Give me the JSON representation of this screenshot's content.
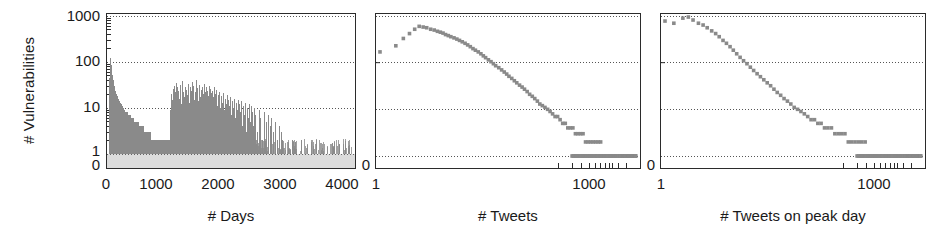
{
  "figure": {
    "background": "#ffffff",
    "marker_color": "#8a8a8a",
    "axis_color": "#2b2b2b",
    "grid_color": "#555555"
  },
  "chart_data": [
    {
      "type": "bar",
      "title": "",
      "panel_index": 1,
      "xlabel": "# Days",
      "ylabel": "# Vulnerabilities",
      "xscale": "linear",
      "yscale": "log",
      "xlim": [
        0,
        4000
      ],
      "ylim": [
        1,
        1000
      ],
      "grid": true,
      "legend": "none",
      "xticks": [
        "0",
        "1000",
        "2000",
        "3000",
        "4000"
      ],
      "xtick_values": [
        0,
        1000,
        2000,
        3000,
        4000
      ],
      "yticks": [
        "1000",
        "100",
        "10",
        "1",
        "0"
      ],
      "ytick_values": [
        1000,
        100,
        10,
        1,
        0
      ],
      "description": "Dense vertical spike histogram of vulnerability counts per day",
      "x": [
        5,
        12,
        18,
        25,
        30,
        36,
        42,
        48,
        55,
        60,
        66,
        72,
        78,
        84,
        90,
        96,
        102,
        108,
        114,
        120,
        126,
        132,
        138,
        144,
        150,
        156,
        162,
        168,
        174,
        180,
        186,
        192,
        198,
        204,
        210,
        216,
        222,
        228,
        234,
        240,
        250,
        260,
        270,
        280,
        290,
        300,
        312,
        324,
        336,
        348,
        360,
        372,
        384,
        396,
        408,
        420,
        432,
        444,
        456,
        468,
        480,
        492,
        504,
        516,
        528,
        540,
        552,
        564,
        576,
        588,
        600,
        612,
        624,
        636,
        648,
        660,
        672,
        684,
        696,
        708,
        720,
        732,
        744,
        756,
        768,
        780,
        792,
        804,
        816,
        828,
        840,
        852,
        864,
        876,
        888,
        900,
        912,
        924,
        936,
        948,
        960,
        972,
        984,
        996,
        1008,
        1020,
        1032,
        1044,
        1056,
        1068,
        1080,
        1092,
        1104,
        1116,
        1128,
        1140,
        1152,
        1164,
        1176,
        1188,
        1200,
        1212,
        1224,
        1236,
        1248,
        1260,
        1272,
        1284,
        1296,
        1308,
        1320,
        1332,
        1344,
        1356,
        1368,
        1380,
        1392,
        1404,
        1416,
        1428,
        1440,
        1452,
        1464,
        1476,
        1488,
        1500,
        1512,
        1524,
        1536,
        1548,
        1560,
        1572,
        1584,
        1596,
        1608,
        1620,
        1632,
        1644,
        1656,
        1668,
        1680,
        1692,
        1704,
        1716,
        1728,
        1740,
        1752,
        1764,
        1776,
        1788,
        1800,
        1815,
        1830,
        1845,
        1860,
        1875,
        1890,
        1905,
        1920,
        1935,
        1950,
        1965,
        1980,
        1995,
        2010,
        2025,
        2040,
        2055,
        2070,
        2085,
        2100,
        2115,
        2130,
        2145,
        2160,
        2175,
        2190,
        2205,
        2220,
        2235,
        2250,
        2265,
        2280,
        2295,
        2310,
        2325,
        2340,
        2355,
        2370,
        2385,
        2400,
        2430,
        2460,
        2490,
        2520,
        2550,
        2580,
        2610,
        2640,
        2670,
        2700,
        2730,
        2760,
        2790,
        2820,
        2850,
        2880,
        2910,
        2940,
        2970,
        3000,
        3040,
        3080,
        3120,
        3160,
        3200,
        3240,
        3280,
        3320,
        3360,
        3400,
        3450,
        3500,
        3550,
        3600,
        3650,
        3700,
        3750,
        3800,
        3850,
        3900,
        3950
      ],
      "values": [
        28,
        44,
        62,
        95,
        120,
        86,
        70,
        58,
        52,
        45,
        40,
        36,
        33,
        30,
        28,
        26,
        24,
        22,
        21,
        20,
        19,
        18,
        17,
        17,
        16,
        15,
        15,
        14,
        14,
        13,
        13,
        12,
        12,
        11,
        11,
        11,
        10,
        10,
        10,
        9,
        9,
        9,
        8,
        8,
        8,
        8,
        7,
        7,
        7,
        7,
        6,
        6,
        6,
        6,
        6,
        5,
        5,
        5,
        5,
        5,
        5,
        4,
        4,
        4,
        4,
        4,
        4,
        4,
        3,
        3,
        3,
        3,
        3,
        3,
        3,
        3,
        3,
        3,
        2,
        2,
        2,
        2,
        2,
        2,
        2,
        2,
        2,
        2,
        2,
        2,
        2,
        2,
        2,
        2,
        2,
        2,
        2,
        2,
        2,
        2,
        2,
        2,
        2,
        2,
        9,
        12,
        20,
        15,
        26,
        30,
        18,
        22,
        35,
        28,
        14,
        24,
        16,
        31,
        20,
        12,
        27,
        38,
        22,
        17,
        29,
        14,
        25,
        19,
        33,
        21,
        13,
        28,
        16,
        24,
        36,
        18,
        30,
        15,
        22,
        40,
        19,
        27,
        14,
        23,
        31,
        17,
        25,
        12,
        28,
        20,
        34,
        16,
        22,
        29,
        13,
        24,
        18,
        30,
        15,
        26,
        21,
        12,
        23,
        17,
        28,
        14,
        20,
        25,
        11,
        19,
        15,
        22,
        10,
        18,
        13,
        21,
        9,
        16,
        12,
        19,
        8,
        15,
        11,
        17,
        7,
        14,
        10,
        16,
        6,
        13,
        9,
        15,
        5,
        12,
        8,
        14,
        4,
        11,
        7,
        13,
        3,
        10,
        6,
        12,
        9,
        5,
        11,
        8,
        4,
        10,
        7,
        3,
        9,
        6,
        2,
        8,
        5,
        7,
        4,
        6,
        3,
        5,
        2,
        4,
        3,
        2,
        1,
        1,
        1,
        1,
        2,
        1,
        1,
        1,
        2,
        1,
        1,
        1,
        1,
        1,
        2,
        1,
        1,
        1,
        1,
        1,
        1,
        1,
        1,
        1,
        1,
        1,
        1,
        2,
        1,
        1,
        1,
        1,
        1,
        1,
        1,
        1,
        1,
        1,
        1,
        1,
        1
      ]
    },
    {
      "type": "scatter",
      "title": "",
      "panel_index": 2,
      "xlabel": "# Tweets",
      "ylabel": "",
      "xscale": "log",
      "yscale": "log",
      "xlim": [
        1,
        2000
      ],
      "ylim": [
        1,
        1000
      ],
      "grid": true,
      "legend": "none",
      "xticks": [
        "1",
        "1000"
      ],
      "xtick_values": [
        1,
        1000
      ],
      "yticks": [
        "0"
      ],
      "ytick_values": [
        0
      ],
      "marker": "square",
      "description": "Distribution of vulnerabilities by number of tweets; hump peaking near 600 around x=3 then power-law decay to a dense floor at y=1",
      "x": [
        1,
        1.6,
        2,
        2.4,
        2.8,
        3.2,
        3.6,
        4,
        4.5,
        5,
        5.5,
        6,
        6.5,
        7,
        7.6,
        8.2,
        9,
        9.8,
        10.6,
        11.5,
        12.5,
        13.5,
        14.6,
        15.8,
        17,
        18.5,
        20,
        21.5,
        23,
        25,
        27,
        29,
        31,
        34,
        37,
        40,
        43,
        46,
        50,
        54,
        58,
        63,
        68,
        73,
        79,
        85,
        92,
        99,
        107,
        115,
        124,
        134,
        145,
        156,
        168,
        181,
        195,
        210,
        227,
        245,
        264,
        285,
        307,
        331,
        357,
        385,
        415,
        447,
        482,
        520,
        560,
        604,
        650,
        700,
        755,
        813,
        876,
        944,
        1017,
        1096,
        1181,
        1273,
        1372,
        1478,
        1593,
        1716,
        1850
      ],
      "values": [
        170,
        230,
        330,
        420,
        520,
        600,
        580,
        560,
        520,
        500,
        470,
        450,
        430,
        400,
        380,
        360,
        340,
        320,
        300,
        280,
        260,
        240,
        220,
        200,
        185,
        170,
        155,
        140,
        128,
        115,
        105,
        95,
        86,
        78,
        70,
        63,
        57,
        51,
        46,
        41,
        37,
        33,
        30,
        27,
        24,
        21,
        19,
        17,
        15,
        13,
        12,
        11,
        10,
        9,
        8,
        7,
        7,
        6,
        5,
        5,
        4,
        4,
        4,
        3,
        3,
        3,
        3,
        2,
        2,
        2,
        2,
        2,
        2,
        2,
        1,
        1,
        1,
        1,
        1,
        1,
        1,
        1,
        1,
        1,
        1,
        1,
        1
      ]
    },
    {
      "type": "scatter",
      "title": "",
      "panel_index": 3,
      "xlabel": "# Tweets on peak day",
      "ylabel": "",
      "xscale": "log",
      "yscale": "log",
      "xlim": [
        1,
        2000
      ],
      "ylim": [
        1,
        1000
      ],
      "grid": true,
      "legend": "none",
      "xticks": [
        "1",
        "1000"
      ],
      "xtick_values": [
        1,
        1000
      ],
      "yticks": [
        "0"
      ],
      "ytick_values": [
        0
      ],
      "marker": "square",
      "description": "Distribution of vulnerabilities by number of tweets on the peak day; starts near 800-1000 and decays steeply to a dense floor at y=1",
      "x": [
        1,
        1.3,
        1.7,
        2,
        2.3,
        2.7,
        3.1,
        3.5,
        4,
        4.5,
        5,
        5.6,
        6.2,
        6.9,
        7.6,
        8.4,
        9.3,
        10.3,
        11.4,
        12.6,
        13.9,
        15.4,
        17,
        18.8,
        20.8,
        23,
        25.4,
        28,
        31,
        34.3,
        37.9,
        41.9,
        46.3,
        51.2,
        56.6,
        62.6,
        69.2,
        76.5,
        84.6,
        93.5,
        103,
        114,
        126,
        140,
        155,
        171,
        189,
        209,
        231,
        255,
        282,
        312,
        345,
        381,
        421,
        465,
        514,
        568,
        628,
        694,
        767,
        848,
        937,
        1036,
        1145,
        1266,
        1399,
        1546,
        1709,
        1889
      ],
      "values": [
        780,
        700,
        900,
        950,
        820,
        700,
        640,
        560,
        480,
        420,
        360,
        300,
        260,
        220,
        185,
        155,
        130,
        110,
        95,
        80,
        68,
        58,
        50,
        43,
        37,
        32,
        27,
        23,
        20,
        17,
        15,
        13,
        11,
        10,
        9,
        8,
        7,
        6,
        6,
        5,
        5,
        4,
        4,
        4,
        3,
        3,
        3,
        3,
        2,
        2,
        2,
        2,
        2,
        2,
        1,
        1,
        1,
        1,
        1,
        1,
        1,
        1,
        1,
        1,
        1,
        1,
        1,
        1,
        1,
        1
      ]
    }
  ]
}
